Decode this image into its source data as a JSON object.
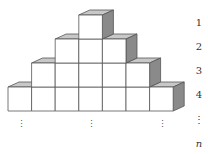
{
  "figure": {
    "rows": [
      {
        "label": "1",
        "count": 1,
        "start_col": 3
      },
      {
        "label": "2",
        "count": 3,
        "start_col": 2
      },
      {
        "label": "3",
        "count": 5,
        "start_col": 1
      },
      {
        "label": "4",
        "count": 7,
        "start_col": 0
      }
    ],
    "continuation_label": "⋮",
    "final_label": "n",
    "column_dots": "⋮",
    "colors": {
      "front_face": "#ffffff",
      "top_face": "#c8c8c8",
      "side_face": "#8a8a8a",
      "edge": "#555555"
    }
  }
}
